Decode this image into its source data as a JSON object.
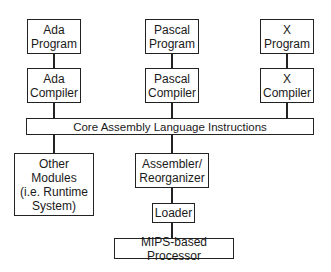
{
  "diagram": {
    "nodes": {
      "ada_program": {
        "line1": "Ada",
        "line2": "Program"
      },
      "ada_compiler": {
        "line1": "Ada",
        "line2": "Compiler"
      },
      "pascal_program": {
        "line1": "Pascal",
        "line2": "Program"
      },
      "pascal_compiler": {
        "line1": "Pascal",
        "line2": "Compiler"
      },
      "x_program": {
        "line1": "X",
        "line2": "Program"
      },
      "x_compiler": {
        "line1": "X",
        "line2": "Compiler"
      },
      "core": {
        "label": "Core Assembly Language Instructions"
      },
      "other_modules": {
        "line1": "Other",
        "line2": "Modules",
        "line3": "(i.e. Runtime",
        "line4": "System)"
      },
      "assembler": {
        "line1": "Assembler/",
        "line2": "Reorganizer"
      },
      "loader": {
        "label": "Loader"
      },
      "mips": {
        "label": "MIPS-based Processor"
      }
    },
    "edges": [
      [
        "Ada Program",
        "Ada Compiler"
      ],
      [
        "Pascal Program",
        "Pascal Compiler"
      ],
      [
        "X Program",
        "X Compiler"
      ],
      [
        "Ada Compiler",
        "Core Assembly Language Instructions"
      ],
      [
        "Pascal Compiler",
        "Core Assembly Language Instructions"
      ],
      [
        "X Compiler",
        "Core Assembly Language Instructions"
      ],
      [
        "Core Assembly Language Instructions",
        "Other Modules (i.e. Runtime System)"
      ],
      [
        "Core Assembly Language Instructions",
        "Assembler/Reorganizer"
      ],
      [
        "Assembler/Reorganizer",
        "Loader"
      ],
      [
        "Loader",
        "MIPS-based Processor"
      ]
    ]
  }
}
